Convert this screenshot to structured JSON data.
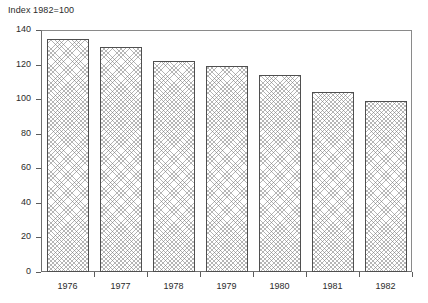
{
  "chart_data": {
    "type": "bar",
    "title": "Index 1982=100",
    "xlabel": "",
    "ylabel": "",
    "categories": [
      "1976",
      "1977",
      "1978",
      "1979",
      "1980",
      "1981",
      "1982"
    ],
    "values": [
      135,
      130,
      122,
      119,
      114,
      104,
      99
    ],
    "ylim": [
      0,
      140
    ],
    "yticks": [
      0,
      20,
      40,
      60,
      80,
      100,
      120,
      140
    ],
    "ytick_labels": [
      "0",
      "20",
      "40",
      "60",
      "80",
      "100",
      "120",
      "140"
    ],
    "grid": false,
    "legend": null,
    "series": [
      {
        "name": "Index 1982=100",
        "values": [
          135,
          130,
          122,
          119,
          114,
          104,
          99
        ]
      }
    ],
    "style": {
      "bar_fill": "#ffffff",
      "bar_hatch": "crosshatch",
      "bar_hatch_color": "#787878",
      "bar_border": "#4f4f4f",
      "frame_color": "#8a8a8a",
      "text_color": "#2b2b2b"
    }
  }
}
